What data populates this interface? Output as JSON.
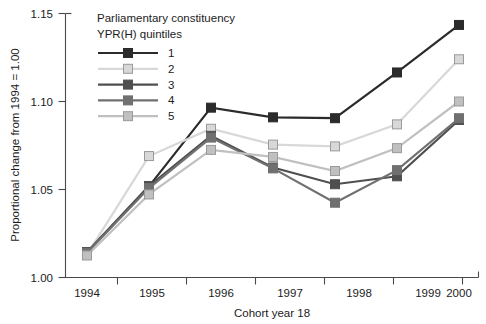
{
  "chart_data": {
    "type": "line",
    "title": "",
    "xlabel": "Cohort year 18",
    "ylabel": "Proportional change from 1994 = 1.00",
    "categories": [
      "1994",
      "1995",
      "1996",
      "1997",
      "1998",
      "1999",
      "2000"
    ],
    "x": [
      1994,
      1995,
      1996,
      1997,
      1998,
      1999,
      2000
    ],
    "ylim": [
      1.0,
      1.15
    ],
    "xlim": [
      1994,
      2000
    ],
    "yticks": [
      "1.00",
      "1.05",
      "1.10",
      "1.15"
    ],
    "ytick_values": [
      1.0,
      1.05,
      1.1,
      1.15
    ],
    "grid": false,
    "legend_position": "top-left-inside",
    "legend_title_line1": "Parliamentary constituency",
    "legend_title_line2": "YPR(H) quintiles",
    "marker": "square",
    "series": [
      {
        "name": "1",
        "color": "#2b2b2b",
        "marker_fill": "#2b2b2b",
        "values": [
          1.014,
          1.0518,
          1.0965,
          1.091,
          1.0905,
          1.1165,
          1.1435
        ]
      },
      {
        "name": "2",
        "color": "#d8d8d8",
        "marker_fill": "#d8d8d8",
        "values": [
          1.013,
          1.069,
          1.0845,
          1.0755,
          1.0745,
          1.087,
          1.124
        ]
      },
      {
        "name": "3",
        "color": "#4f4f4f",
        "marker_fill": "#4f4f4f",
        "values": [
          1.0145,
          1.052,
          1.0805,
          1.0625,
          1.053,
          1.0575,
          1.0895
        ]
      },
      {
        "name": "4",
        "color": "#707070",
        "marker_fill": "#707070",
        "values": [
          1.014,
          1.0508,
          1.0795,
          1.062,
          1.0425,
          1.061,
          1.0905
        ]
      },
      {
        "name": "5",
        "color": "#c0c0c0",
        "marker_fill": "#c0c0c0",
        "values": [
          1.0125,
          1.0472,
          1.0725,
          1.0685,
          1.0605,
          1.0735,
          1.1
        ]
      }
    ]
  },
  "axis": {
    "y_title": "Proportional change from 1994 = 1.00",
    "x_title": "Cohort year 18",
    "y_tick_labels": [
      "1.15",
      "1.10",
      "1.05",
      "1.00"
    ],
    "x_tick_labels": [
      "1994",
      "1995",
      "1996",
      "1997",
      "1998",
      "1999",
      "2000"
    ]
  },
  "legend": {
    "title_line1": "Parliamentary constituency",
    "title_line2": "YPR(H) quintiles",
    "entries": [
      {
        "label": "1",
        "color": "#2b2b2b"
      },
      {
        "label": "2",
        "color": "#d8d8d8"
      },
      {
        "label": "3",
        "color": "#4f4f4f"
      },
      {
        "label": "4",
        "color": "#707070"
      },
      {
        "label": "5",
        "color": "#c0c0c0"
      }
    ]
  }
}
